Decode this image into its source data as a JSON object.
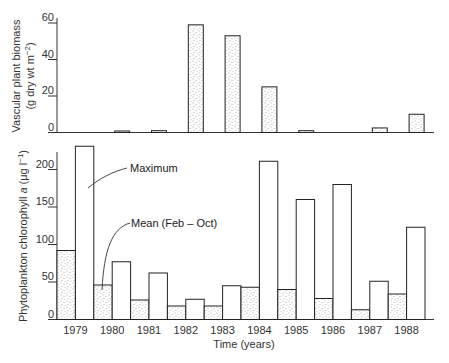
{
  "chart_data": [
    {
      "type": "bar",
      "panel": "top",
      "title": "",
      "xlabel": "",
      "ylabel": "Vascular plant biomass",
      "ylabel_units": "(g dry wt m⁻²)",
      "ylim": [
        0,
        60
      ],
      "yticks": [
        0,
        20,
        40,
        60
      ],
      "grid": false,
      "categories": [
        "1979",
        "1980",
        "1981",
        "1982",
        "1983",
        "1984",
        "1985",
        "1986",
        "1987",
        "1988"
      ],
      "series": [
        {
          "name": "Vascular plant biomass",
          "fill": "stippled",
          "values": [
            0,
            0.5,
            1,
            59,
            53,
            25,
            1,
            0,
            2.5,
            10
          ]
        }
      ]
    },
    {
      "type": "bar",
      "panel": "bottom",
      "title": "",
      "xlabel": "Time (years)",
      "ylabel": "Phytoplankton chlorophyll a (μg l⁻¹)",
      "ylim": [
        0,
        230
      ],
      "yticks": [
        0,
        50,
        100,
        150,
        200
      ],
      "grid": false,
      "categories": [
        "1979",
        "1980",
        "1981",
        "1982",
        "1983",
        "1984",
        "1985",
        "1986",
        "1987",
        "1988"
      ],
      "series": [
        {
          "name": "Mean (Feb – Oct)",
          "fill": "stippled",
          "values": [
            92,
            46,
            26,
            18,
            18,
            43,
            40,
            28,
            13,
            34
          ]
        },
        {
          "name": "Maximum",
          "fill": "white",
          "values": [
            231,
            77,
            62,
            27,
            45,
            211,
            160,
            180,
            51,
            123
          ]
        }
      ],
      "annotations": [
        {
          "text": "Maximum",
          "points_to": "1979 Maximum bar"
        },
        {
          "text": "Mean (Feb – Oct)",
          "points_to": "1980 Mean bar"
        }
      ]
    }
  ],
  "labels": {
    "top_ylabel_line1": "Vascular plant biomass",
    "top_ylabel_line2": "(g dry wt m",
    "top_ylabel_sup": "−2",
    "top_ylabel_close": ")",
    "bottom_ylabel_pre": "Phytoplankton chlorophyll ",
    "bottom_ylabel_italic": "a",
    "bottom_ylabel_post": " (μg l",
    "bottom_ylabel_sup": "−1",
    "bottom_ylabel_close": ")",
    "xlabel": "Time (years)",
    "annot_max": "Maximum",
    "annot_mean": "Mean (Feb – Oct)"
  }
}
